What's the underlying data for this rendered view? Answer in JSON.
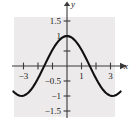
{
  "figure": {
    "name": "cosine-graph",
    "background_color": "#ffffff",
    "plot_area_color": "#eceaea",
    "curve_color": "#111111",
    "axis_color": "#3a3a3a"
  },
  "chart_data": {
    "type": "line",
    "title": "",
    "subtitle": "",
    "xlabel": "x",
    "ylabel": "y",
    "grid": false,
    "legend": "none",
    "xlim": [
      -3.7,
      3.7
    ],
    "ylim": [
      -1.75,
      1.75
    ],
    "xticks": [
      -3,
      -2,
      -1,
      1,
      2,
      3
    ],
    "yticks": [
      -1.5,
      -1,
      -0.5,
      0.5,
      1,
      1.5
    ],
    "xtick_labels": [
      {
        "value": -3,
        "label": "−3"
      },
      {
        "value": -2,
        "label": ""
      },
      {
        "value": -1,
        "label": ""
      },
      {
        "value": 1,
        "label": "1"
      },
      {
        "value": 2,
        "label": ""
      },
      {
        "value": 3,
        "label": "3"
      }
    ],
    "ytick_labels": [
      {
        "value": 1.5,
        "label": "1.5"
      },
      {
        "value": 1,
        "label": "1"
      },
      {
        "value": 0.5,
        "label": ""
      },
      {
        "value": -0.5,
        "label": "−0.5"
      },
      {
        "value": -1,
        "label": "−1"
      },
      {
        "value": -1.5,
        "label": "−1.5"
      }
    ],
    "series": [
      {
        "name": "y = cos(x)",
        "function": "cos(x)",
        "x": [
          -3.7,
          -3.55,
          -3.4,
          -3.25,
          -3.1,
          -2.95,
          -2.8,
          -2.65,
          -2.5,
          -2.35,
          -2.2,
          -2.05,
          -1.9,
          -1.75,
          -1.6,
          -1.45,
          -1.3,
          -1.15,
          -1.0,
          -0.85,
          -0.7,
          -0.55,
          -0.4,
          -0.25,
          -0.1,
          0.0,
          0.1,
          0.25,
          0.4,
          0.55,
          0.7,
          0.85,
          1.0,
          1.15,
          1.3,
          1.45,
          1.6,
          1.75,
          1.9,
          2.05,
          2.2,
          2.35,
          2.5,
          2.65,
          2.8,
          2.95,
          3.1,
          3.25,
          3.4,
          3.55,
          3.7
        ],
        "y": [
          -0.848,
          -0.914,
          -0.967,
          -0.994,
          -0.999,
          -0.981,
          -0.942,
          -0.882,
          -0.801,
          -0.703,
          -0.589,
          -0.461,
          -0.323,
          -0.178,
          -0.029,
          0.12,
          0.267,
          0.408,
          0.54,
          0.66,
          0.765,
          0.853,
          0.921,
          0.969,
          0.995,
          1.0,
          0.995,
          0.969,
          0.921,
          0.853,
          0.765,
          0.66,
          0.54,
          0.408,
          0.267,
          0.12,
          -0.029,
          -0.178,
          -0.323,
          -0.461,
          -0.589,
          -0.703,
          -0.801,
          -0.882,
          -0.942,
          -0.981,
          -0.999,
          -0.994,
          -0.967,
          -0.914,
          -0.848
        ]
      }
    ],
    "annotations": [
      {
        "name": "x-axis-arrowhead",
        "text": ""
      },
      {
        "name": "y-axis-arrowhead",
        "text": ""
      }
    ]
  }
}
